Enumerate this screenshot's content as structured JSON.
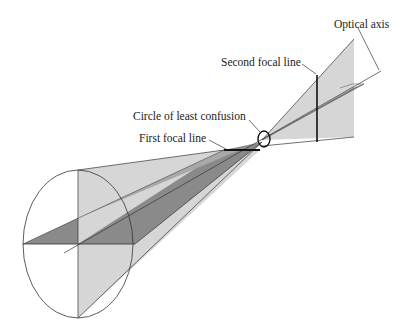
{
  "diagram": {
    "labels": {
      "optical_axis": "Optical axis",
      "second_focal_line": "Second focal line",
      "circle_of_least_confusion": "Circle of least confusion",
      "first_focal_line": "First focal line"
    },
    "colors": {
      "light_fill": "#d6d6d6",
      "dark_fill": "#8a8a8a",
      "stroke": "#333333",
      "background": "#ffffff"
    }
  }
}
